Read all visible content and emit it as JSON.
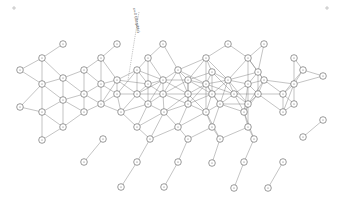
{
  "diagram": {
    "title": "",
    "width": 341,
    "height": 213,
    "colors": {
      "node_stroke": "#555555",
      "edge": "#7a7a7a",
      "background": "#ffffff"
    },
    "node_radius": 3.3,
    "annotation": {
      "text": "x=0 (illegible)",
      "x": 133,
      "y": 8,
      "rotation": 80,
      "leader": [
        [
          139,
          12
        ],
        [
          128,
          80
        ]
      ]
    },
    "corner_markers": [
      {
        "x": 14,
        "y": 8
      },
      {
        "x": 327,
        "y": 8
      }
    ],
    "nodes": [
      [
        63,
        44
      ],
      [
        117,
        44
      ],
      [
        163,
        44
      ],
      [
        228,
        44
      ],
      [
        264,
        44
      ],
      [
        42,
        58
      ],
      [
        101,
        58
      ],
      [
        148,
        58
      ],
      [
        206,
        58
      ],
      [
        248,
        58
      ],
      [
        294,
        58
      ],
      [
        20,
        70
      ],
      [
        84,
        70
      ],
      [
        137,
        70
      ],
      [
        178,
        70
      ],
      [
        212,
        72
      ],
      [
        258,
        72
      ],
      [
        303,
        70
      ],
      [
        323,
        76
      ],
      [
        42,
        84
      ],
      [
        63,
        78
      ],
      [
        101,
        84
      ],
      [
        117,
        80
      ],
      [
        148,
        84
      ],
      [
        163,
        80
      ],
      [
        188,
        80
      ],
      [
        206,
        84
      ],
      [
        228,
        80
      ],
      [
        248,
        84
      ],
      [
        264,
        80
      ],
      [
        294,
        84
      ],
      [
        84,
        94
      ],
      [
        117,
        94
      ],
      [
        137,
        94
      ],
      [
        163,
        94
      ],
      [
        188,
        94
      ],
      [
        212,
        94
      ],
      [
        234,
        94
      ],
      [
        258,
        94
      ],
      [
        283,
        94
      ],
      [
        63,
        100
      ],
      [
        101,
        104
      ],
      [
        148,
        104
      ],
      [
        188,
        104
      ],
      [
        220,
        104
      ],
      [
        248,
        104
      ],
      [
        294,
        104
      ],
      [
        20,
        107
      ],
      [
        42,
        112
      ],
      [
        84,
        112
      ],
      [
        121,
        112
      ],
      [
        164,
        112
      ],
      [
        206,
        112
      ],
      [
        244,
        112
      ],
      [
        283,
        112
      ],
      [
        323,
        120
      ],
      [
        42,
        140
      ],
      [
        103,
        139
      ],
      [
        150,
        139
      ],
      [
        188,
        139
      ],
      [
        220,
        139
      ],
      [
        254,
        139
      ],
      [
        303,
        137
      ],
      [
        63,
        127
      ],
      [
        137,
        127
      ],
      [
        178,
        127
      ],
      [
        212,
        127
      ],
      [
        248,
        127
      ],
      [
        84,
        162
      ],
      [
        137,
        162
      ],
      [
        178,
        162
      ],
      [
        212,
        163
      ],
      [
        244,
        162
      ],
      [
        283,
        162
      ],
      [
        121,
        187
      ],
      [
        164,
        187
      ],
      [
        234,
        188
      ],
      [
        268,
        188
      ]
    ],
    "edges_rule": "connect each node to neighbors within 32px"
  }
}
